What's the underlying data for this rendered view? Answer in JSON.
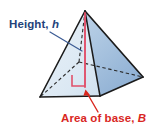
{
  "figure": {
    "name": "pyramid-volume-diagram",
    "kind": "geometric-solid-illustration",
    "shape": "square pyramid",
    "labels": {
      "height": {
        "text": "Height, h",
        "lead_text": "Height,",
        "variable": "h",
        "color": "#24427a"
      },
      "base": {
        "text": "Area of base, B",
        "lead_text": "Area of base,",
        "variable": "B",
        "color": "#d9271f"
      }
    },
    "colors": {
      "face_left": "#dde8f4",
      "face_right": "#9fbcdc",
      "base_front": "#e8a4b4",
      "base_back": "#d9a8c0",
      "edge": "#1b1b1b",
      "height_line": "#e0506a",
      "leader_line": "#3b5b94",
      "arrow": "#d9271f",
      "background": "#ffffff"
    },
    "annotations": {
      "height_segment": "vertical segment from apex to base center",
      "right_angle_marker": "right angle at base center",
      "hidden_edges": "dashed lines for back edges"
    }
  }
}
